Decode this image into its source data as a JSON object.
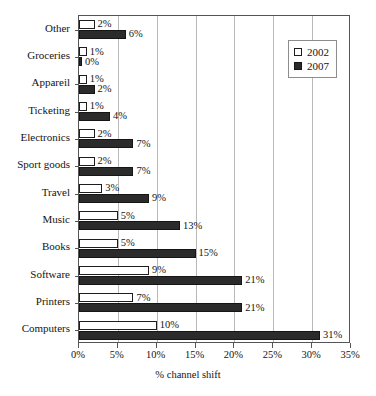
{
  "chart_data": {
    "type": "bar",
    "orientation": "horizontal",
    "title": "",
    "xlabel": "% channel shift",
    "ylabel": "",
    "xlim": [
      0,
      35
    ],
    "xtick_labels": [
      "0%",
      "5%",
      "10%",
      "15%",
      "20%",
      "25%",
      "30%",
      "35%"
    ],
    "xtick_values": [
      0,
      5,
      10,
      15,
      20,
      25,
      30,
      35
    ],
    "grid": "vertical",
    "legend_position": "top-right",
    "categories": [
      "Other",
      "Groceries",
      "Appareil",
      "Ticketing",
      "Electronics",
      "Sport goods",
      "Travel",
      "Music",
      "Books",
      "Software",
      "Printers",
      "Computers"
    ],
    "series": [
      {
        "name": "2002",
        "style": "open",
        "values": [
          2,
          1,
          1,
          1,
          2,
          2,
          3,
          5,
          5,
          9,
          7,
          10
        ],
        "value_labels": [
          "2%",
          "1%",
          "1%",
          "1%",
          "2%",
          "2%",
          "3%",
          "5%",
          "5%",
          "9%",
          "7%",
          "10%"
        ]
      },
      {
        "name": "2007",
        "style": "filled",
        "values": [
          6,
          0,
          2,
          4,
          7,
          7,
          9,
          13,
          15,
          21,
          21,
          31
        ],
        "value_labels": [
          "6%",
          "0%",
          "2%",
          "4%",
          "7%",
          "7%",
          "9%",
          "13%",
          "15%",
          "21%",
          "21%",
          "31%"
        ]
      }
    ]
  },
  "legend": {
    "items": [
      {
        "label": "2002",
        "style": "open"
      },
      {
        "label": "2007",
        "style": "filled"
      }
    ]
  },
  "colors": {
    "series_2002_fill": "#ffffff",
    "series_2002_stroke": "#1d1d1d",
    "series_2007_fill": "#2b2b2b",
    "axis": "#555555",
    "gridline": "#b9b9b9",
    "text": "#141414"
  }
}
